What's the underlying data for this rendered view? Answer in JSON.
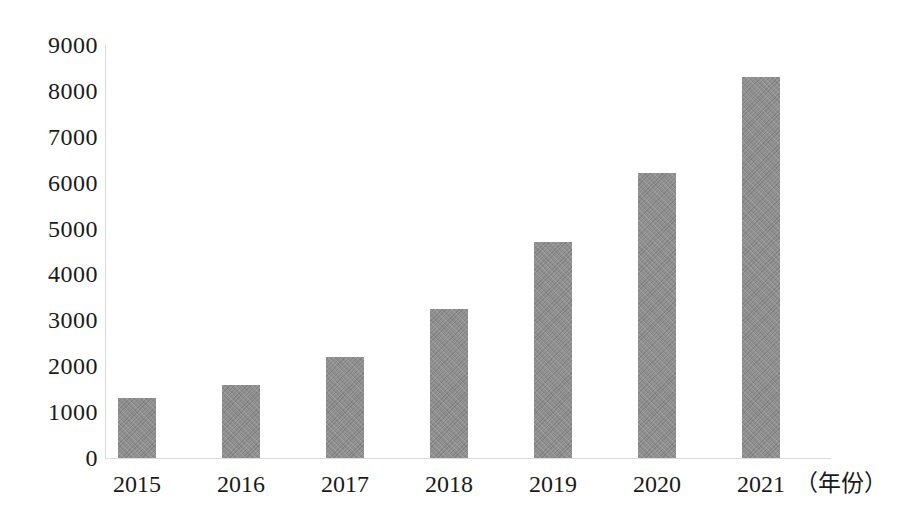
{
  "chart_data": {
    "type": "bar",
    "title": "",
    "subtitle": "",
    "xlabel": "（年份）",
    "ylabel": "",
    "categories": [
      "2015",
      "2016",
      "2017",
      "2018",
      "2019",
      "2020",
      "2021"
    ],
    "values": [
      1300,
      1600,
      2200,
      3250,
      4700,
      6200,
      8300
    ],
    "series": [
      {
        "name": "",
        "values": [
          1300,
          1600,
          2200,
          3250,
          4700,
          6200,
          8300
        ]
      }
    ],
    "ylim": [
      0,
      9000
    ],
    "y_ticks": [
      "0",
      "1000",
      "2000",
      "3000",
      "4000",
      "5000",
      "6000",
      "7000",
      "8000",
      "9000"
    ],
    "y_tick_values": [
      0,
      1000,
      2000,
      3000,
      4000,
      5000,
      6000,
      7000,
      8000,
      9000
    ],
    "x_ticks": [
      "2015",
      "2016",
      "2017",
      "2018",
      "2019",
      "2020",
      "2021"
    ],
    "grid": false,
    "legend": [],
    "legend_position": "none",
    "annotations": [],
    "colors": {
      "bar_fill": "#8b8b8b",
      "axis_line": "#dcdcdc",
      "text": "#1a1a1a",
      "background": "#ffffff"
    }
  }
}
